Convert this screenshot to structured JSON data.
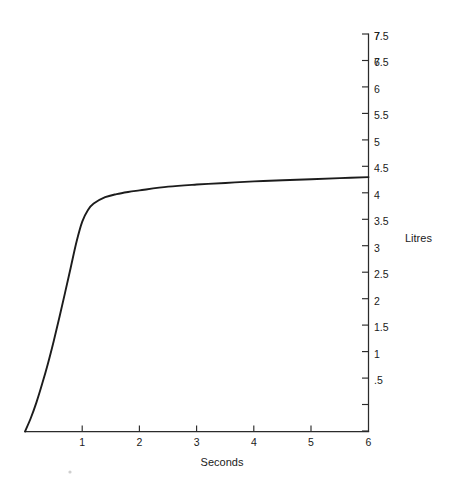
{
  "page": {
    "background_color": "#ffffff",
    "ink_color": "#1c1c1c"
  },
  "chart_data": {
    "type": "line",
    "title": "",
    "subtitle": "",
    "xlabel": "Seconds",
    "ylabel": "Litres",
    "ylabel_position": "right-axis-inline",
    "xlim": [
      0,
      6
    ],
    "ylim": [
      0,
      7.5
    ],
    "grid": false,
    "legend": null,
    "legend_position": "none",
    "x_axis_position": "bottom",
    "y_axis_position": "right",
    "x_tick_labels": [
      "1",
      "2",
      "3",
      "4",
      "5",
      "6"
    ],
    "x_tick_values": [
      1,
      2,
      3,
      4,
      5,
      6
    ],
    "y_tick_labels": [
      ".5",
      "1",
      "1.5",
      "2",
      "2.5",
      "3",
      "3.5",
      "4",
      "4.5",
      "5",
      "5.5",
      "6",
      "6.5",
      "7",
      "7.5"
    ],
    "y_tick_values": [
      0.5,
      1,
      1.5,
      2,
      2.5,
      3,
      3.5,
      4,
      4.5,
      5,
      5.5,
      6,
      6.5,
      7,
      7.5
    ],
    "series": [
      {
        "name": "Expired volume",
        "x": [
          0.0,
          0.1,
          0.2,
          0.3,
          0.4,
          0.5,
          0.6,
          0.7,
          0.8,
          0.9,
          1.0,
          1.1,
          1.2,
          1.4,
          1.6,
          1.8,
          2.0,
          2.5,
          3.0,
          3.5,
          4.0,
          4.5,
          5.0,
          5.5,
          6.0
        ],
        "y": [
          0.0,
          0.25,
          0.55,
          0.9,
          1.28,
          1.7,
          2.15,
          2.62,
          3.1,
          3.58,
          3.96,
          4.18,
          4.3,
          4.42,
          4.48,
          4.52,
          4.55,
          4.62,
          4.66,
          4.69,
          4.72,
          4.74,
          4.76,
          4.78,
          4.8
        ]
      }
    ],
    "annotations": []
  },
  "artifacts": {
    "speck_label": "scan-speck"
  }
}
